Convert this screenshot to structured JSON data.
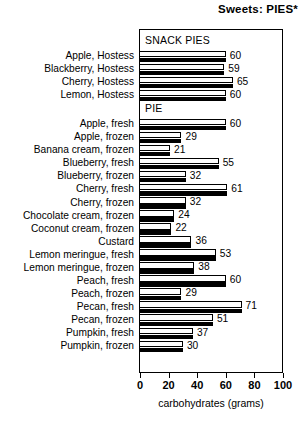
{
  "chart_data": {
    "type": "bar",
    "orientation": "horizontal",
    "title": "Sweets: PIES*",
    "xlabel": "carbohydrates (grams)",
    "ylabel": "",
    "xlim": [
      0,
      100
    ],
    "xticks": [
      0,
      20,
      40,
      60,
      80,
      100
    ],
    "xtick_labels": [
      "0",
      "20",
      "40",
      "60",
      "80",
      "100"
    ],
    "grid": false,
    "legend": "none",
    "group_headers": [
      "SNACK PIES",
      "PIE"
    ],
    "groups": [
      {
        "name": "SNACK PIES",
        "categories": [
          "Apple, Hostess",
          "Blackberry, Hostess",
          "Cherry, Hostess",
          "Lemon, Hostess"
        ],
        "values": [
          60,
          59,
          65,
          60
        ]
      },
      {
        "name": "PIE",
        "categories": [
          "Apple, fresh",
          "Apple, frozen",
          "Banana cream, frozen",
          "Blueberry, fresh",
          "Blueberry, frozen",
          "Cherry, fresh",
          "Cherry, frozen",
          "Chocolate cream, frozen",
          "Coconut cream, frozen",
          "Custard",
          "Lemon meringue, fresh",
          "Lemon meringue, frozen",
          "Peach, fresh",
          "Peach, frozen",
          "Pecan, fresh",
          "Pecan, frozen",
          "Pumpkin, fresh",
          "Pumpkin, frozen"
        ],
        "values": [
          60,
          29,
          21,
          55,
          32,
          61,
          32,
          24,
          22,
          36,
          53,
          38,
          60,
          29,
          71,
          51,
          37,
          30
        ]
      }
    ],
    "categories": [
      "Apple, Hostess",
      "Blackberry, Hostess",
      "Cherry, Hostess",
      "Lemon, Hostess",
      "Apple, fresh",
      "Apple, frozen",
      "Banana cream, frozen",
      "Blueberry, fresh",
      "Blueberry, frozen",
      "Cherry, fresh",
      "Cherry, frozen",
      "Chocolate cream, frozen",
      "Coconut cream, frozen",
      "Custard",
      "Lemon meringue, fresh",
      "Lemon meringue, frozen",
      "Peach, fresh",
      "Peach, frozen",
      "Pecan, fresh",
      "Pecan, frozen",
      "Pumpkin, fresh",
      "Pumpkin, frozen"
    ],
    "values": [
      60,
      59,
      65,
      60,
      60,
      29,
      21,
      55,
      32,
      61,
      32,
      24,
      22,
      36,
      53,
      38,
      60,
      29,
      71,
      51,
      37,
      30
    ],
    "colors": {
      "bar_fill": "#ffffff",
      "bar_outline": "#000000",
      "bar_shadow": "#000000",
      "frame": "#000000",
      "text": "#000000",
      "background": "#ffffff"
    }
  }
}
